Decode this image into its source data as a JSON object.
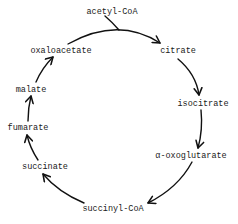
{
  "diagram": {
    "nodes": {
      "acetyl_coa": "acetyl-CoA",
      "citrate": "citrate",
      "isocitrate": "isocitrate",
      "alpha_oxoglutarate": "α-oxoglutarate",
      "succinyl_coa": "succinyl-CoA",
      "succinate": "succinate",
      "fumarate": "fumarate",
      "malate": "malate",
      "oxaloacetate": "oxaloacetate"
    },
    "edges": [
      {
        "from": "oxaloacetate",
        "to": "citrate",
        "input": "acetyl-CoA"
      },
      {
        "from": "citrate",
        "to": "isocitrate"
      },
      {
        "from": "isocitrate",
        "to": "α-oxoglutarate"
      },
      {
        "from": "α-oxoglutarate",
        "to": "succinyl-CoA"
      },
      {
        "from": "succinyl-CoA",
        "to": "succinate"
      },
      {
        "from": "succinate",
        "to": "fumarate"
      },
      {
        "from": "fumarate",
        "to": "malate"
      },
      {
        "from": "malate",
        "to": "oxaloacetate"
      }
    ],
    "colors": {
      "stroke": "#111111",
      "text": "#1a1a1a",
      "background": "#ffffff"
    }
  }
}
